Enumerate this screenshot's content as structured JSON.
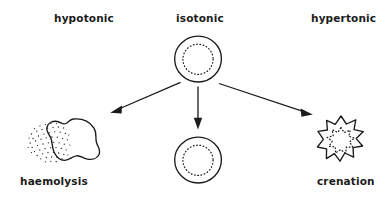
{
  "figure": {
    "background_color": "#ffffff",
    "ink_color": "#1b1b1b",
    "width": 391,
    "height": 200
  },
  "labels": {
    "hypotonic": "hypotonic",
    "isotonic": "isotonic",
    "hypertonic": "hypertonic",
    "haemolysis": "haemolysis",
    "crenation": "crenation"
  },
  "diagram_data": {
    "type": "diagram",
    "description": "A central isotonic red blood cell with three arrows pointing to three outcome cells",
    "nodes": [
      {
        "id": "isotonic-cell",
        "label": "isotonic",
        "column": "centre",
        "row": "top",
        "shape": "circle-with-dotted-inner-circle",
        "cx": 198,
        "cy": 59,
        "r": 23,
        "inner_r": 15
      },
      {
        "id": "haemolysis-cell",
        "label": "haemolysis",
        "column": "left",
        "row": "bottom",
        "shape": "irregular-blob-with-stipple",
        "cx": 65,
        "cy": 140,
        "note": "swollen burst cell with released stippled contents"
      },
      {
        "id": "normal-cell",
        "label": "",
        "column": "centre",
        "row": "bottom",
        "shape": "circle-with-dotted-inner-circle",
        "cx": 198,
        "cy": 160,
        "r": 23,
        "inner_r": 15
      },
      {
        "id": "crenation-cell",
        "label": "crenation",
        "column": "right",
        "row": "bottom",
        "shape": "spiky-star-with-dotted-inner-star",
        "cx": 341,
        "cy": 138,
        "outer_r": 22,
        "inner_r": 12
      }
    ],
    "edges": [
      {
        "id": "arrow-left",
        "from": "isotonic-cell",
        "to": "haemolysis-cell",
        "direction": "down-left",
        "x1": 181,
        "y1": 82,
        "x2": 112,
        "y2": 112
      },
      {
        "id": "arrow-centre",
        "from": "isotonic-cell",
        "to": "normal-cell",
        "direction": "down",
        "x1": 198,
        "y1": 87,
        "x2": 198,
        "y2": 128
      },
      {
        "id": "arrow-right",
        "from": "isotonic-cell",
        "to": "crenation-cell",
        "direction": "down-right",
        "x1": 219,
        "y1": 84,
        "x2": 312,
        "y2": 115
      }
    ],
    "columns": [
      {
        "tonicity": "hypotonic",
        "outcome": "haemolysis"
      },
      {
        "tonicity": "isotonic",
        "outcome": ""
      },
      {
        "tonicity": "hypertonic",
        "outcome": "crenation"
      }
    ]
  }
}
